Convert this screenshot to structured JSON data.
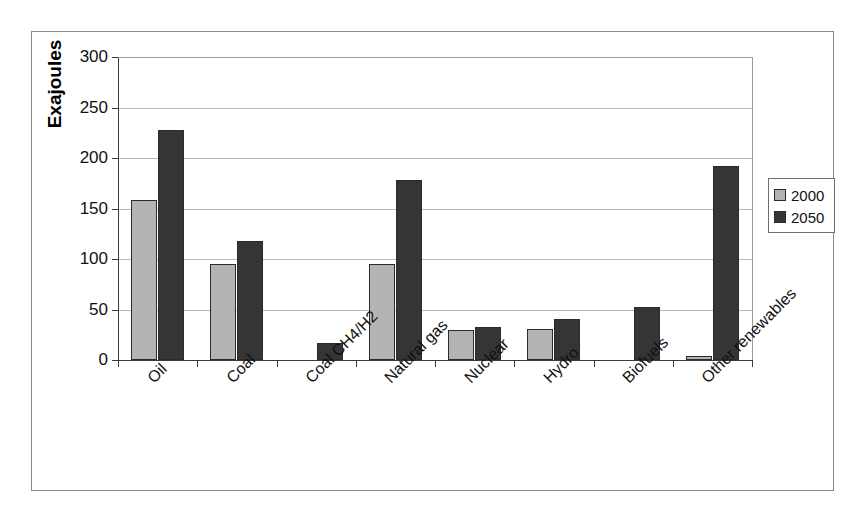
{
  "chart_data": {
    "type": "bar",
    "title": "",
    "xlabel": "",
    "ylabel": "Exajoules",
    "ylim": [
      0,
      300
    ],
    "yticks": [
      0,
      50,
      100,
      150,
      200,
      250,
      300
    ],
    "ytick_labels": [
      "0",
      "50",
      "100",
      "150",
      "200",
      "250",
      "300"
    ],
    "grid": "horizontal",
    "legend_position": "right-outside",
    "categories": [
      "Oil",
      "Coal",
      "Coal CH4/H2",
      "Natural gas",
      "Nuclear",
      "Hydro",
      "Biofuels",
      "Other renewables"
    ],
    "series": [
      {
        "name": "2000",
        "color": "#b4b4b4",
        "values": [
          158,
          95,
          0,
          95,
          30,
          31,
          0,
          4
        ]
      },
      {
        "name": "2050",
        "color": "#353535",
        "values": [
          228,
          118,
          17,
          178,
          33,
          41,
          52,
          192
        ]
      }
    ]
  },
  "legend": {
    "items": [
      {
        "label": "2000"
      },
      {
        "label": "2050"
      }
    ]
  }
}
